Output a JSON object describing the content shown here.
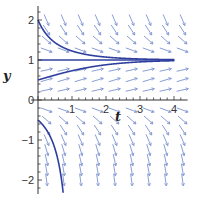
{
  "chart_data": {
    "type": "slope-field",
    "title": "",
    "xlabel": "t",
    "ylabel": "y",
    "xlim": [
      -0.2,
      4.5
    ],
    "ylim": [
      -2.35,
      2.35
    ],
    "x_ticks": [
      1,
      2,
      3,
      4
    ],
    "y_ticks": [
      2,
      1,
      0,
      -1,
      -2
    ],
    "x_tick_labels": [
      "1",
      "2",
      "3",
      "4"
    ],
    "y_tick_labels": [
      "2",
      "1",
      "0",
      "−1",
      "−2"
    ],
    "grid": false,
    "legend": null,
    "equation_approx": "dy/dt = y(1 - y)",
    "field_t": [
      0.25,
      0.75,
      1.25,
      1.75,
      2.25,
      2.75,
      3.25,
      3.75,
      4.25
    ],
    "field_y": [
      2.0,
      1.75,
      1.5,
      1.25,
      0.75,
      0.5,
      0.25,
      -0.25,
      -0.5,
      -0.75,
      -1.0,
      -1.25,
      -1.5,
      -1.75,
      -2.0
    ],
    "solution_curves": [
      {
        "name": "y0=2",
        "y0": 2.0,
        "t_end": 4.0
      },
      {
        "name": "y0=1 (equilibrium)",
        "y0": 1.0,
        "t_end": 4.0
      },
      {
        "name": "y0=0.5",
        "y0": 0.5,
        "t_end": 4.0
      },
      {
        "name": "y0=-0.5",
        "y0": -0.5,
        "t_end": 4.0
      }
    ],
    "colors": {
      "field": "#8a9ed6",
      "curve": "#2f3f9e",
      "axis": "#333333"
    }
  }
}
